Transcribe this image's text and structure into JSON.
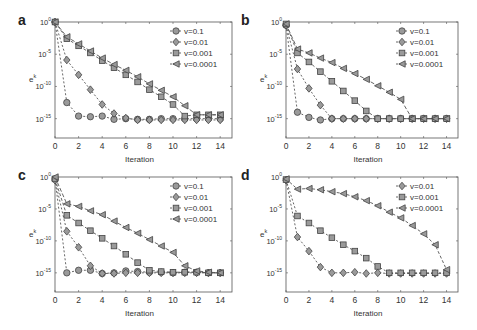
{
  "chart_data": [
    {
      "panel": "a",
      "type": "line",
      "xlabel": "Iteration",
      "ylabel": "e^k",
      "yscale": "log",
      "xlim": [
        0,
        15
      ],
      "ylim_exp": [
        -18,
        0
      ],
      "xticks": [
        0,
        2,
        4,
        6,
        8,
        10,
        12,
        14
      ],
      "yticks": [
        "10^0",
        "10^-5",
        "10^-10",
        "10^-15"
      ],
      "legend_position": "upper right",
      "x": [
        0,
        1,
        2,
        3,
        4,
        5,
        6,
        7,
        8,
        9,
        10,
        11,
        12,
        13,
        14
      ],
      "series": [
        {
          "name": "v=0.1",
          "marker": "circle",
          "log10_values": [
            0,
            -12.5,
            -14.6,
            -14.7,
            -14.6,
            -15.1,
            -15.0,
            -15.1,
            -15.1,
            -15.0,
            -15.0,
            -15.0,
            -15.0,
            -15.0,
            -15.0
          ]
        },
        {
          "name": "v=0.01",
          "marker": "diamond",
          "log10_values": [
            0,
            -5.9,
            -8.2,
            -10.5,
            -12.8,
            -14.2,
            -14.9,
            -15.2,
            -15.2,
            -15.2,
            -15.2,
            -15.2,
            -15.2,
            -15.2,
            -15.2
          ]
        },
        {
          "name": "v=0.001",
          "marker": "square",
          "log10_values": [
            0,
            -2.6,
            -3.7,
            -4.8,
            -6.0,
            -7.1,
            -8.2,
            -9.3,
            -10.5,
            -11.6,
            -12.8,
            -14.6,
            -14.4,
            -14.4,
            -14.4
          ]
        },
        {
          "name": "v=0.0001",
          "marker": "triangle-left",
          "log10_values": [
            0,
            -2.3,
            -3.4,
            -4.5,
            -5.6,
            -6.6,
            -7.5,
            -8.5,
            -9.6,
            -10.6,
            -11.6,
            -13.0,
            -14.4,
            -14.4,
            -14.4
          ]
        }
      ]
    },
    {
      "panel": "b",
      "type": "line",
      "xlabel": "Iteration",
      "ylabel": "e^k",
      "yscale": "log",
      "xlim": [
        0,
        15
      ],
      "ylim_exp": [
        -18,
        0
      ],
      "xticks": [
        0,
        2,
        4,
        6,
        8,
        10,
        12,
        14
      ],
      "yticks": [
        "10^0",
        "10^-5",
        "10^-10",
        "10^-15"
      ],
      "legend_position": "upper right",
      "x": [
        0,
        1,
        2,
        3,
        4,
        5,
        6,
        7,
        8,
        9,
        10,
        11,
        12,
        13,
        14
      ],
      "series": [
        {
          "name": "v=0.1",
          "marker": "circle",
          "log10_values": [
            -0.5,
            -14.0,
            -14.8,
            -15.2,
            -15.0,
            -15.0,
            -15.0,
            -15.0,
            -15.0,
            -15.0,
            -15.0,
            -15.0,
            -15.0,
            -15.0,
            -15.0
          ]
        },
        {
          "name": "v=0.01",
          "marker": "diamond",
          "log10_values": [
            -0.5,
            -7.3,
            -10.3,
            -12.9,
            -15.0,
            -15.0,
            -15.0,
            -15.0,
            -15.0,
            -15.0,
            -15.0,
            -15.0,
            -15.0,
            -15.0,
            -15.0
          ]
        },
        {
          "name": "v=0.001",
          "marker": "square",
          "log10_values": [
            -0.3,
            -4.8,
            -6.2,
            -7.7,
            -9.2,
            -10.7,
            -12.2,
            -13.8,
            -15.0,
            -15.0,
            -15.0,
            -15.0,
            -15.0,
            -15.0,
            -15.0
          ]
        },
        {
          "name": "v=0.0001",
          "marker": "triangle-left",
          "log10_values": [
            -0.3,
            -4.2,
            -4.8,
            -5.6,
            -6.3,
            -7.2,
            -8.0,
            -8.9,
            -9.9,
            -10.9,
            -12.0,
            -15.0,
            -15.0,
            -15.0,
            -15.0
          ]
        }
      ]
    },
    {
      "panel": "c",
      "type": "line",
      "xlabel": "Iteration",
      "ylabel": "e^k",
      "yscale": "log",
      "xlim": [
        0,
        15
      ],
      "ylim_exp": [
        -18,
        0
      ],
      "xticks": [
        0,
        2,
        4,
        6,
        8,
        10,
        12,
        14
      ],
      "yticks": [
        "10^0",
        "10^-5",
        "10^-10",
        "10^-15"
      ],
      "legend_position": "upper right",
      "x": [
        0,
        1,
        2,
        3,
        4,
        5,
        6,
        7,
        8,
        9,
        10,
        11,
        12,
        13,
        14
      ],
      "series": [
        {
          "name": "v=0.1",
          "marker": "circle",
          "log10_values": [
            -0.3,
            -15.0,
            -14.6,
            -14.6,
            -15.1,
            -15.0,
            -14.7,
            -14.8,
            -14.9,
            -14.9,
            -15.0,
            -14.9,
            -14.9,
            -15.0,
            -15.0
          ]
        },
        {
          "name": "v=0.01",
          "marker": "diamond",
          "log10_values": [
            -0.5,
            -8.5,
            -11.0,
            -13.9,
            -15.1,
            -15.1,
            -15.0,
            -15.0,
            -15.0,
            -15.0,
            -15.0,
            -15.0,
            -15.0,
            -15.0,
            -15.0
          ]
        },
        {
          "name": "v=0.001",
          "marker": "square",
          "log10_values": [
            -0.3,
            -6.0,
            -7.2,
            -8.4,
            -9.6,
            -10.8,
            -12.1,
            -13.4,
            -14.6,
            -14.8,
            -14.9,
            -14.9,
            -14.9,
            -15.0,
            -15.0
          ]
        },
        {
          "name": "v=0.0001",
          "marker": "triangle-left",
          "log10_values": [
            0,
            -4.2,
            -4.6,
            -5.3,
            -5.9,
            -6.9,
            -7.9,
            -8.8,
            -9.8,
            -10.8,
            -11.8,
            -13.9,
            -14.7,
            -14.9,
            -15.0
          ]
        }
      ]
    },
    {
      "panel": "d",
      "type": "line",
      "xlabel": "Iteration",
      "ylabel": "e^k",
      "yscale": "log",
      "xlim": [
        0,
        15
      ],
      "ylim_exp": [
        -18,
        0
      ],
      "xticks": [
        0,
        2,
        4,
        6,
        8,
        10,
        12,
        14
      ],
      "yticks": [
        "10^0",
        "10^-5",
        "10^-10",
        "10^-15"
      ],
      "legend_position": "upper right",
      "x": [
        0,
        1,
        2,
        3,
        4,
        5,
        6,
        7,
        8,
        9,
        10,
        11,
        12,
        13,
        14
      ],
      "series": [
        {
          "name": "v=0.01",
          "marker": "diamond",
          "log10_values": [
            -0.5,
            -9.4,
            -11.6,
            -14.1,
            -15.0,
            -15.0,
            -14.9,
            -15.1,
            -15.0,
            -15.1,
            -15.1,
            -15.1,
            -15.1,
            -15.1,
            -15.1
          ]
        },
        {
          "name": "v=0.001",
          "marker": "square",
          "log10_values": [
            -0.4,
            -6.1,
            -7.2,
            -8.4,
            -9.5,
            -10.6,
            -11.6,
            -12.7,
            -14.0,
            -15.0,
            -15.0,
            -15.0,
            -15.0,
            -15.0,
            -15.0
          ]
        },
        {
          "name": "v=0.0001",
          "marker": "triangle-left",
          "log10_values": [
            -0.3,
            -1.9,
            -1.8,
            -2.0,
            -2.3,
            -2.6,
            -3.1,
            -3.7,
            -4.5,
            -5.5,
            -6.4,
            -7.6,
            -8.9,
            -10.6,
            -14.5
          ]
        }
      ]
    }
  ],
  "panels": [
    {
      "label": "a"
    },
    {
      "label": "b"
    },
    {
      "label": "c"
    },
    {
      "label": "d"
    }
  ]
}
